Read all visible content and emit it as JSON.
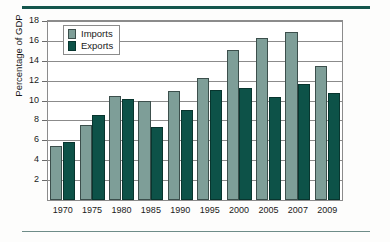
{
  "chart_data": {
    "type": "bar",
    "title": "",
    "subtitle": "",
    "xlabel": "",
    "ylabel": "Percentage of GDP",
    "categories": [
      "1970",
      "1975",
      "1980",
      "1985",
      "1990",
      "1995",
      "2000",
      "2005",
      "2007",
      "2009"
    ],
    "series": [
      {
        "name": "Imports",
        "color": "#7e9e98",
        "values": [
          5.4,
          7.5,
          10.5,
          10.0,
          11.0,
          12.3,
          15.1,
          16.3,
          16.9,
          13.5
        ]
      },
      {
        "name": "Exports",
        "color": "#0d5248",
        "values": [
          5.8,
          8.5,
          10.2,
          7.3,
          9.1,
          11.1,
          11.3,
          10.4,
          11.7,
          10.8
        ]
      }
    ],
    "ylim": [
      0,
      18
    ],
    "yticks": [
      2,
      4,
      6,
      8,
      10,
      12,
      14,
      16,
      18
    ],
    "ytick_labels": [
      "2",
      "4",
      "6",
      "8",
      "10",
      "12",
      "14",
      "16",
      "18"
    ],
    "grid": true,
    "legend_position": "top-left"
  },
  "decor": {
    "rule_top_color": "#14564c",
    "rule_bottom_color": "#6e8c88"
  }
}
